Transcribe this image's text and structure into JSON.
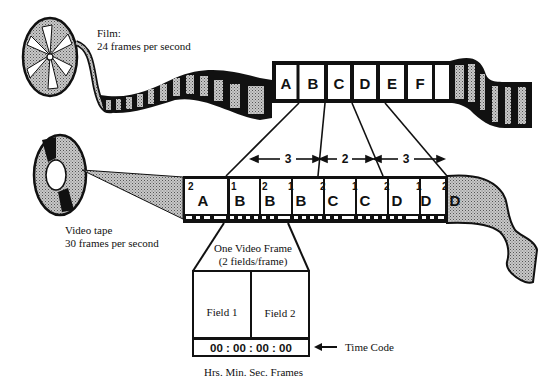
{
  "film": {
    "label_line1": "Film:",
    "label_line2": "24 frames per second",
    "frames": [
      "A",
      "B",
      "C",
      "D",
      "E",
      "F",
      ""
    ]
  },
  "video": {
    "label_line1": "Video tape",
    "label_line2": "30 frames per second",
    "frames": [
      {
        "field": "2",
        "letter": "A"
      },
      {
        "field": "1",
        "letter": "B"
      },
      {
        "field": "2",
        "letter": "B"
      },
      {
        "field": "1",
        "letter": "B"
      },
      {
        "field": "2",
        "letter": "C"
      },
      {
        "field": "1",
        "letter": "C"
      },
      {
        "field": "2",
        "letter": "D"
      },
      {
        "field": "1",
        "letter": "D"
      },
      {
        "field": "2",
        "letter": "D"
      }
    ]
  },
  "pulldown": {
    "groups": [
      "3",
      "2",
      "3"
    ]
  },
  "detail": {
    "title_line1": "One Video Frame",
    "title_line2": "(2 fields/frame)",
    "field1": "Field 1",
    "field2": "Field 2",
    "timecode": "00 : 00 : 00 : 00",
    "timecode_label": "Time Code",
    "timecode_units": "Hrs. Min. Sec. Frames"
  },
  "colors": {
    "ink": "#111111",
    "paper": "#ffffff",
    "stipple": "#9a9a9a"
  }
}
